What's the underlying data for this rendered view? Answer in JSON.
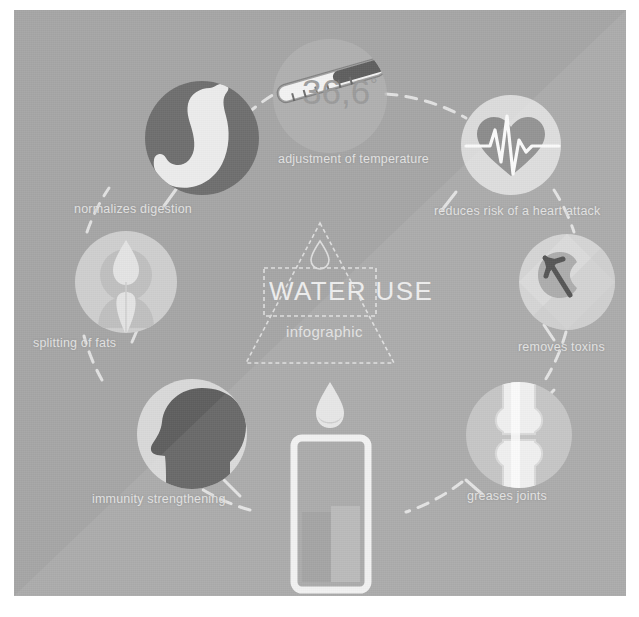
{
  "poster": {
    "background_color": "#a6a6a6",
    "accent_light": "#e8e8e8",
    "accent_dark": "#6b6b6b",
    "text_color": "#eeeeee"
  },
  "center": {
    "title": "WATER USE",
    "subtitle": "infographic",
    "droplet_icon": "water-droplet-icon",
    "triangle_shape": "triangle-outline"
  },
  "thermometer": {
    "value": "36,6",
    "degree_symbol": "°",
    "icon": "thermometer-icon"
  },
  "bottom_visual": {
    "glass_icon": "water-glass-icon",
    "droplet_icon": "water-droplet-icon"
  },
  "nodes": [
    {
      "id": "adjustment-of-temperature",
      "label": "adjustment of temperature",
      "icon": "thermometer-icon",
      "label_x": 264,
      "label_y": 142,
      "circle_cx": 316,
      "circle_cy": 86,
      "circle_r": 57,
      "circle_fill": "#b4b4b4"
    },
    {
      "id": "normalizes-digestion",
      "label": "normalizes digestion",
      "icon": "stomach-icon",
      "label_x": 60,
      "label_y": 192,
      "circle_cx": 188,
      "circle_cy": 128,
      "circle_r": 57,
      "circle_fill": "#6f6f6f"
    },
    {
      "id": "reduces-risk-of-a-heart-attack",
      "label": "reduces risk of a heart attack",
      "icon": "heart-pulse-icon",
      "label_x": 420,
      "label_y": 194,
      "circle_cx": 497,
      "circle_cy": 135,
      "circle_r": 50,
      "circle_fill": "#dcdcdc"
    },
    {
      "id": "removes-toxins",
      "label": "removes toxins",
      "icon": "kidney-arrow-icon",
      "label_x": 504,
      "label_y": 330,
      "circle_cx": 553,
      "circle_cy": 272,
      "circle_r": 48,
      "circle_fill": "#d2d2d2"
    },
    {
      "id": "splitting-of-fats",
      "label": "splitting of fats",
      "icon": "fat-splitting-icon",
      "label_x": 19,
      "label_y": 326,
      "circle_cx": 112,
      "circle_cy": 272,
      "circle_r": 51,
      "circle_fill": "#cfcfcf"
    },
    {
      "id": "immunity-strengthening",
      "label": "immunity strengthening",
      "icon": "head-silhouette-icon",
      "label_x": 78,
      "label_y": 482,
      "circle_cx": 178,
      "circle_cy": 424,
      "circle_r": 55,
      "circle_fill": "#d9d9d9"
    },
    {
      "id": "greases-joints",
      "label": "greases joints",
      "icon": "joint-bone-icon",
      "label_x": 453,
      "label_y": 479,
      "circle_cx": 505,
      "circle_cy": 425,
      "circle_r": 53,
      "circle_fill": "#c2c2c2"
    }
  ]
}
